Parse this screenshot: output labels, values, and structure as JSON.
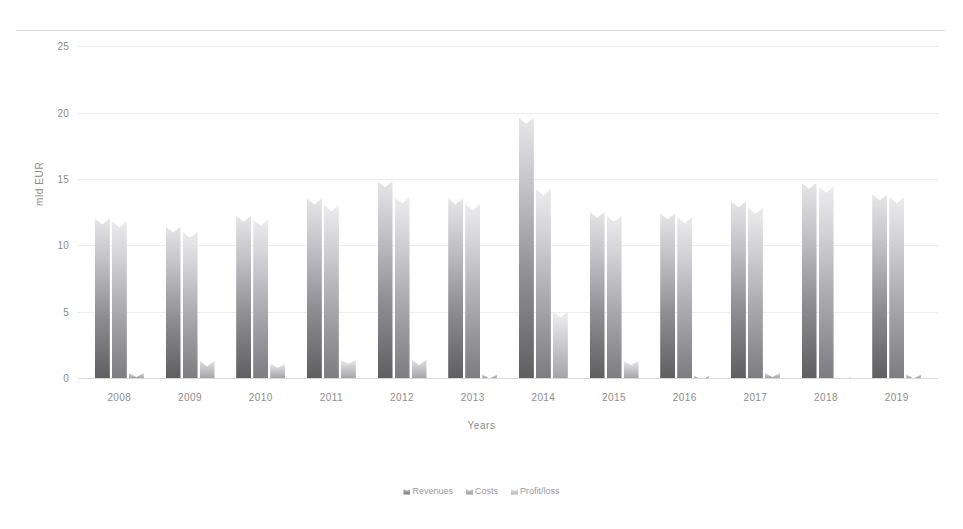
{
  "chart_data": {
    "type": "bar",
    "title": "",
    "xlabel": "Years",
    "ylabel": "mld EUR",
    "categories": [
      "2008",
      "2009",
      "2010",
      "2011",
      "2012",
      "2013",
      "2014",
      "2015",
      "2016",
      "2017",
      "2018",
      "2019"
    ],
    "yticks": [
      0,
      5,
      10,
      15,
      20,
      25
    ],
    "ylim": [
      0,
      26
    ],
    "grid": true,
    "legend_position": "bottom",
    "series": [
      {
        "name": "Revenues",
        "color": "#76767a",
        "values": [
          12.4,
          11.8,
          12.6,
          13.9,
          15.2,
          13.9,
          20.0,
          12.9,
          12.8,
          13.7,
          15.1,
          14.2
        ]
      },
      {
        "name": "Costs",
        "color": "#9a9a9e",
        "values": [
          12.2,
          11.4,
          12.3,
          13.4,
          14.0,
          13.5,
          14.6,
          12.6,
          12.5,
          13.2,
          14.8,
          14.0
        ]
      },
      {
        "name": "Profit/loss",
        "color": "#b4b4b8",
        "values": [
          10.8,
          10.4,
          11.1,
          12.5,
          13.5,
          12.7,
          14.2,
          11.5,
          11.7,
          12.7,
          14.5,
          13.3
        ]
      },
      {
        "name": "Profit/loss-residual",
        "color": "#c9c9cd",
        "values": [
          0.6,
          1.7,
          1.3,
          1.6,
          1.8,
          0.5,
          5.4,
          1.5,
          0.4,
          0.6,
          0.3,
          0.5
        ]
      }
    ]
  },
  "axis": {
    "y_label": "mld EUR",
    "x_label": "Years",
    "y_tick_labels": [
      "25",
      "20",
      "15",
      "10",
      "5",
      "0"
    ]
  },
  "legend": {
    "items": [
      {
        "label": "Revenues"
      },
      {
        "label": "Costs"
      },
      {
        "label": "Profit/loss"
      }
    ]
  }
}
